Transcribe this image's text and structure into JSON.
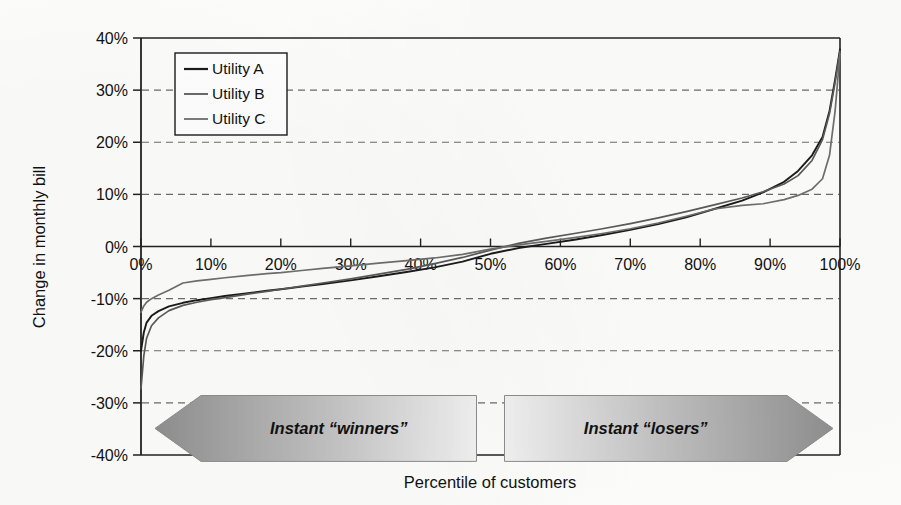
{
  "chart_data": {
    "type": "line",
    "title": "",
    "xlabel": "Percentile of customers",
    "ylabel": "Change in monthly bill",
    "xlim": [
      0,
      100
    ],
    "ylim": [
      -40,
      40
    ],
    "grid": true,
    "grid_style": "dashed-horizontal",
    "legend_position": "top-left-inside",
    "x_ticks": [
      "0%",
      "10%",
      "20%",
      "30%",
      "40%",
      "50%",
      "60%",
      "70%",
      "80%",
      "90%",
      "100%"
    ],
    "x_tick_values": [
      0,
      10,
      20,
      30,
      40,
      50,
      60,
      70,
      80,
      90,
      100
    ],
    "y_ticks": [
      "40%",
      "30%",
      "20%",
      "10%",
      "0%",
      "-10%",
      "-20%",
      "-30%",
      "-40%"
    ],
    "y_tick_values": [
      40,
      30,
      20,
      10,
      0,
      -10,
      -20,
      -30,
      -40
    ],
    "x": [
      0,
      0.4,
      0.8,
      1.5,
      2.5,
      4,
      6,
      8,
      10,
      12,
      15,
      18,
      20,
      23,
      26,
      30,
      34,
      38,
      42,
      46,
      50,
      54,
      58,
      62,
      66,
      70,
      74,
      78,
      82,
      86,
      89,
      92,
      94,
      96,
      97.5,
      98.5,
      99.3,
      100
    ],
    "series": [
      {
        "name": "Utility A",
        "color": "#1b1b1b",
        "values": [
          -20.0,
          -16.5,
          -14.6,
          -13.3,
          -12.4,
          -11.5,
          -10.8,
          -10.3,
          -9.9,
          -9.5,
          -9.0,
          -8.5,
          -8.2,
          -7.7,
          -7.2,
          -6.5,
          -5.7,
          -4.9,
          -4.0,
          -2.9,
          -1.4,
          -0.3,
          0.5,
          1.3,
          2.2,
          3.2,
          4.3,
          5.6,
          7.2,
          8.8,
          10.4,
          12.4,
          14.5,
          17.5,
          21.0,
          26.0,
          32.0,
          37.8
        ]
      },
      {
        "name": "Utility B",
        "color": "#5a5a5a",
        "values": [
          -27.3,
          -21.0,
          -17.6,
          -15.2,
          -13.7,
          -12.3,
          -11.3,
          -10.7,
          -10.2,
          -9.8,
          -9.2,
          -8.6,
          -8.2,
          -7.6,
          -7.0,
          -6.2,
          -5.3,
          -4.4,
          -3.3,
          -2.1,
          -0.7,
          0.6,
          1.6,
          2.5,
          3.4,
          4.4,
          5.5,
          6.7,
          8.0,
          9.3,
          10.5,
          12.0,
          13.6,
          16.5,
          20.5,
          25.5,
          31.5,
          37.5
        ]
      },
      {
        "name": "Utility C",
        "color": "#6e6e6e",
        "values": [
          -12.6,
          -11.4,
          -10.7,
          -10.0,
          -9.3,
          -8.4,
          -7.0,
          -6.6,
          -6.3,
          -6.0,
          -5.6,
          -5.2,
          -5.0,
          -4.6,
          -4.2,
          -3.7,
          -3.2,
          -2.7,
          -2.2,
          -1.5,
          -0.5,
          0.3,
          1.0,
          1.7,
          2.5,
          3.4,
          4.5,
          5.8,
          7.2,
          7.9,
          8.2,
          9.0,
          9.8,
          11.0,
          13.0,
          17.5,
          26.0,
          37.0
        ]
      }
    ],
    "annotations": [
      {
        "name": "winners-banner",
        "label": "Instant “winners”",
        "direction": "left",
        "x_start": 2,
        "x_end": 48
      },
      {
        "name": "losers-banner",
        "label": "Instant “losers”",
        "direction": "right",
        "x_start": 52,
        "x_end": 99
      }
    ]
  },
  "legend": {
    "items": [
      {
        "label": "Utility A"
      },
      {
        "label": "Utility B"
      },
      {
        "label": "Utility C"
      }
    ]
  },
  "colors": {
    "series_a": "#1b1b1b",
    "series_b": "#5a5a5a",
    "series_c": "#6e6e6e",
    "axis": "#222222",
    "grid": "#6b6b6b",
    "banner_dark": "#9a9a9a",
    "banner_light": "#ededed",
    "background": "#fdfdfc"
  }
}
